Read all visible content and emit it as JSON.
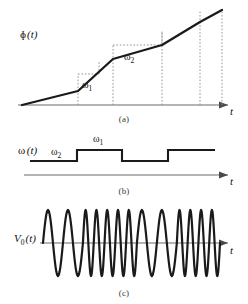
{
  "figure": {
    "stroke_color": "#1a1a1a",
    "axis_color": "#6b6b6b",
    "dotted_color": "#8a8a8a"
  },
  "panels": [
    {
      "id": "a",
      "caption": "(a)",
      "ylabel": "φ (t)",
      "ylabel_symbol": "φ",
      "ylabel_arg": "(t)",
      "xlabel": "t",
      "slope_labels": [
        {
          "text": "ω",
          "sub": "1"
        },
        {
          "text": "ω",
          "sub": "2"
        }
      ]
    },
    {
      "id": "b",
      "caption": "(b)",
      "ylabel_symbol": "ω",
      "ylabel_arg": "(t)",
      "xlabel": "t",
      "level_labels": [
        {
          "text": "ω",
          "sub": "2"
        },
        {
          "text": "ω",
          "sub": "1"
        }
      ]
    },
    {
      "id": "c",
      "caption": "(c)",
      "ylabel_symbol": "V",
      "ylabel_sub": "0",
      "ylabel_arg": "(t)",
      "xlabel": "t"
    }
  ],
  "chart_data": [
    {
      "type": "line",
      "panel": "a",
      "title": "φ (t)",
      "xlabel": "t",
      "ylabel": "φ (t)",
      "grid": false,
      "legend": "none",
      "xlim": [
        0,
        10
      ],
      "ylim": [
        0,
        10
      ],
      "description": "Piecewise-linear accumulated phase; slope alternates between ω₂ (shallow) and ω₁ (steep)",
      "x": [
        0.55,
        2.35,
        3.85,
        5.95,
        7.65,
        9.4
      ],
      "y": [
        0.0,
        1.45,
        4.05,
        5.25,
        7.2,
        9.55
      ],
      "segment_slopes": [
        "ω₂",
        "ω₁",
        "ω₂",
        "ω₁",
        "ω₂"
      ],
      "annotations": [
        {
          "label": "ω₁",
          "at_x": 3.2,
          "at_y": 2.3
        },
        {
          "label": "ω₂",
          "at_x": 6.3,
          "at_y": 5.5
        }
      ],
      "dropline_x": [
        2.35,
        3.85,
        5.95,
        7.65,
        9.4
      ]
    },
    {
      "type": "line",
      "panel": "b",
      "title": "ω (t)",
      "xlabel": "t",
      "ylabel": "ω (t)",
      "grid": false,
      "legend": "none",
      "xlim": [
        0,
        10
      ],
      "ylim": [
        0,
        2
      ],
      "description": "Square-wave instantaneous frequency switching between the low level ω₂ and the high level ω₁",
      "step_edges_x": [
        0.6,
        3.2,
        5.05,
        6.95,
        8.05,
        9.6
      ],
      "levels": [
        "ω₂",
        "ω₁",
        "ω₂",
        "ω₁"
      ],
      "level_values": [
        1,
        2,
        1,
        2
      ],
      "low_label": "ω₂",
      "high_label": "ω₁"
    },
    {
      "type": "line",
      "panel": "c",
      "title": "V₀ (t)",
      "xlabel": "t",
      "ylabel": "V₀ (t)",
      "grid": false,
      "legend": "none",
      "xlim": [
        0,
        10
      ],
      "ylim": [
        -1,
        1
      ],
      "description": "Output sinusoid whose instantaneous frequency follows ω (t): alternating bursts of low-frequency and high-frequency cycles, constant amplitude",
      "bursts": [
        {
          "frequency": "low",
          "cycles": 2
        },
        {
          "frequency": "high",
          "cycles": 5
        },
        {
          "frequency": "low",
          "cycles": 2
        },
        {
          "frequency": "high",
          "cycles": 4
        }
      ],
      "amplitude": 1.0
    }
  ]
}
